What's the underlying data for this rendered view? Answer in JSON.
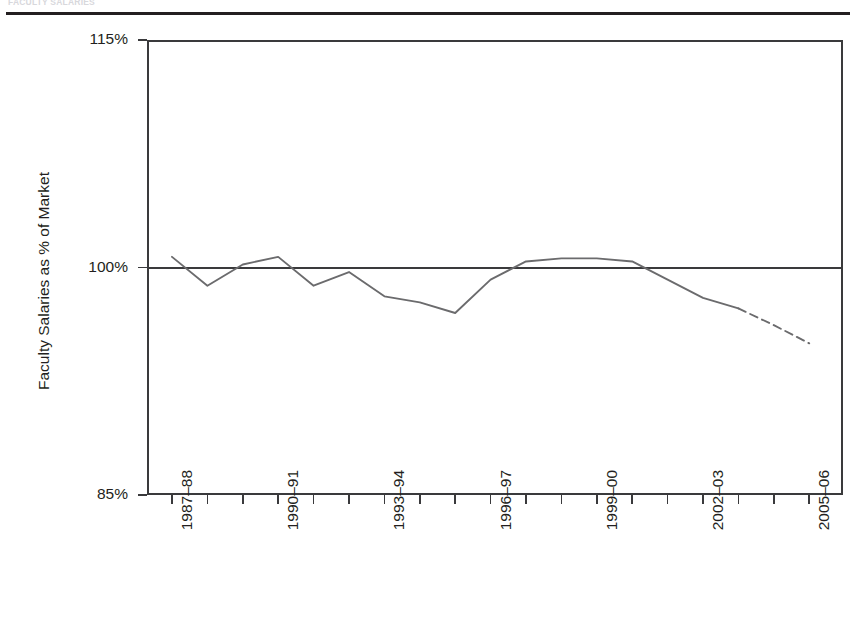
{
  "figure": {
    "caption_fragment": "FACULTY SALARIES",
    "top_rule": "divider"
  },
  "chart_data": {
    "type": "line",
    "title": "",
    "subtitle": "",
    "xlabel": "",
    "ylabel": "Faculty Salaries as % of Market",
    "ylim": [
      85,
      115
    ],
    "ytick_labels": [
      "115%",
      "100%",
      "85%"
    ],
    "ytick_values": [
      115,
      100,
      85
    ],
    "grid": false,
    "legend": "none",
    "reference_line": {
      "value": 100,
      "label": "100% of market"
    },
    "x_tick_labels": [
      "1987–88",
      "",
      "",
      "1990–91",
      "",
      "",
      "1993–94",
      "",
      "",
      "1996–97",
      "",
      "",
      "1999–00",
      "",
      "",
      "2002–03",
      "",
      "",
      "2005–06"
    ],
    "x": [
      "1987–88",
      "1988–89",
      "1989–90",
      "1990–91",
      "1991–92",
      "1992–93",
      "1993–94",
      "1994–95",
      "1995–96",
      "1996–97",
      "1997–98",
      "1998–99",
      "1999–00",
      "2000–01",
      "2001–02",
      "2002–03",
      "2003–04",
      "2004–05",
      "2005–06"
    ],
    "series": [
      {
        "name": "Faculty salaries as % of market (actual)",
        "style": "solid",
        "color": "#6b6b6d",
        "values": [
          100.7,
          98.8,
          100.2,
          100.7,
          98.8,
          99.7,
          98.1,
          97.7,
          97.0,
          99.2,
          100.4,
          100.6,
          100.6,
          100.4,
          99.2,
          98.0,
          97.3,
          null,
          null
        ]
      },
      {
        "name": "Projected",
        "style": "dashed",
        "color": "#6b6b6d",
        "values": [
          null,
          null,
          null,
          null,
          null,
          null,
          null,
          null,
          null,
          null,
          null,
          null,
          null,
          null,
          null,
          null,
          97.3,
          96.2,
          95.0
        ]
      }
    ]
  },
  "axis_ticks": {
    "y_count": 3,
    "x_count": 19
  }
}
